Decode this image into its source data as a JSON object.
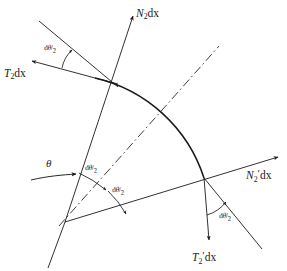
{
  "figure": {
    "background_color": "#ffffff",
    "line_color": "#1a1a1a",
    "arc_color": "#1a1a1a"
  },
  "labels": {
    "n2dx": {
      "base": "N",
      "sub": "2",
      "prime": "",
      "operand": "dx"
    },
    "n2pdx": {
      "base": "N",
      "sub": "2",
      "prime": "′",
      "operand": "dx"
    },
    "t2dx": {
      "base": "T",
      "sub": "2",
      "prime": "",
      "operand": "dx"
    },
    "t2pdx": {
      "base": "T",
      "sub": "2",
      "prime": "′",
      "operand": "dx"
    },
    "theta": "θ",
    "half_angle": {
      "d": "d",
      "greek": "θ",
      "slash": "/",
      "denominator": "2"
    }
  },
  "annotations": [
    {
      "id": "angle-top-left",
      "text": "dθ/2",
      "x": 44,
      "y": 44
    },
    {
      "id": "angle-center-upper",
      "text": "dθ/2",
      "x": 85,
      "y": 164
    },
    {
      "id": "angle-center-lower",
      "text": "dθ/2",
      "x": 112,
      "y": 186
    },
    {
      "id": "angle-bottom-right",
      "text": "dθ/2",
      "x": 219,
      "y": 212
    }
  ],
  "geometry": {
    "vertex": {
      "x": 65,
      "y": 222
    },
    "arc_top_point": {
      "x": 95,
      "y": 78
    },
    "arc_right_point": {
      "x": 204,
      "y": 178
    },
    "centerline_outer": {
      "x": 219,
      "y": 46
    },
    "stroke_width": 0.9,
    "arc_stroke_width": 1.5
  }
}
